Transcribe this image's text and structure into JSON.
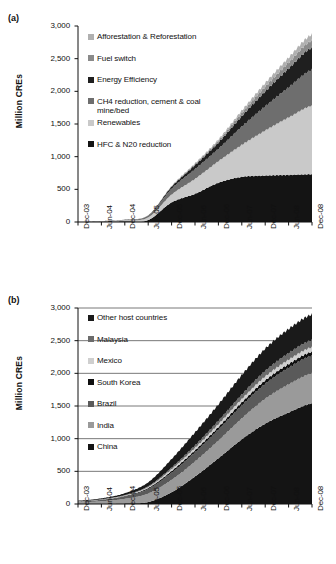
{
  "figure": {
    "background": "#ffffff",
    "panels": [
      {
        "id": "a",
        "label": "(a)",
        "ylabel": "Million CREs"
      },
      {
        "id": "b",
        "label": "(b)",
        "ylabel": "Million CREs"
      }
    ]
  },
  "chart_data": [
    {
      "type": "area",
      "panel": "a",
      "title": "",
      "xlabel": "",
      "ylabel": "Million CREs",
      "ylim": [
        0,
        3000
      ],
      "yticks": [
        0,
        500,
        1000,
        1500,
        2000,
        2500,
        3000
      ],
      "ytick_labels": [
        "0",
        "500",
        "1,000",
        "1,500",
        "2,000",
        "2,500",
        "3,000"
      ],
      "grid": false,
      "legend_position": "inside-top-left",
      "x": [
        "Dec-03",
        "Jun-04",
        "Dec-04",
        "Jun-05",
        "Dec-05",
        "Jun-06",
        "Dec-06",
        "Jun-07",
        "Dec-07",
        "Jun-08",
        "Dec-08"
      ],
      "xtick_labels": [
        "Dec-03",
        "Jun-04",
        "Dec-04",
        "Jun-05",
        "Dec-05",
        "Jun-06",
        "Dec-06",
        "Jun-07",
        "Dec-07",
        "Jun-08",
        "Dec-08"
      ],
      "stack_order_bottom_to_top": [
        "HFC & N20 reduction",
        "Renewables",
        "CH4 reduction, cement & coal mine/bed",
        "Energy Efficiency",
        "Fuel switch",
        "Afforestation & Reforestation"
      ],
      "series": [
        {
          "name": "HFC & N20 reduction",
          "color": "#141414",
          "values": [
            0,
            5,
            12,
            30,
            300,
            430,
            600,
            690,
            710,
            720,
            730
          ]
        },
        {
          "name": "Renewables",
          "color": "#c9c9c9",
          "values": [
            2,
            6,
            14,
            40,
            120,
            230,
            330,
            490,
            690,
            880,
            1050
          ]
        },
        {
          "name": "CH4 reduction, cement & coal mine/bed",
          "color": "#6e6e6e",
          "values": [
            1,
            3,
            8,
            25,
            90,
            150,
            190,
            280,
            370,
            460,
            550
          ]
        },
        {
          "name": "Energy Efficiency",
          "color": "#1f1f1f",
          "values": [
            0,
            1,
            2,
            6,
            30,
            60,
            95,
            160,
            230,
            290,
            340
          ]
        },
        {
          "name": "Fuel switch",
          "color": "#8a8a8a",
          "values": [
            0,
            0,
            1,
            2,
            8,
            18,
            30,
            50,
            70,
            90,
            110
          ]
        },
        {
          "name": "Afforestation & Reforestation",
          "color": "#b0b0b0",
          "values": [
            0,
            0,
            0,
            1,
            4,
            10,
            18,
            35,
            55,
            75,
            90
          ]
        }
      ],
      "cumulative_top_at_last_x": 2870,
      "legend": [
        {
          "label": "Afforestation & Reforestation",
          "color": "#b0b0b0"
        },
        {
          "label": "Fuel switch",
          "color": "#8a8a8a"
        },
        {
          "label": "Energy Efficiency",
          "color": "#1f1f1f"
        },
        {
          "label": "CH4 reduction, cement & coal\nmine/bed",
          "color": "#6e6e6e"
        },
        {
          "label": "Renewables",
          "color": "#c9c9c9"
        },
        {
          "label": "HFC & N20 reduction",
          "color": "#141414"
        }
      ]
    },
    {
      "type": "area",
      "panel": "b",
      "title": "",
      "xlabel": "",
      "ylabel": "Million CREs",
      "ylim": [
        0,
        3000
      ],
      "yticks": [
        0,
        500,
        1000,
        1500,
        2000,
        2500,
        3000
      ],
      "ytick_labels": [
        "0",
        "500",
        "1,000",
        "1,500",
        "2,000",
        "2,500",
        "3,000"
      ],
      "grid": true,
      "legend_position": "inside-top-left",
      "x": [
        "Dec-03",
        "Jun-04",
        "Dec-04",
        "Jun-05",
        "Dec-05",
        "Jun-06",
        "Dec-06",
        "Jun-07",
        "Dec-07",
        "Jun-08",
        "Dec-08"
      ],
      "xtick_labels": [
        "Dec-03",
        "Jun-04",
        "Dec-04",
        "Jun-05",
        "Dec-05",
        "Jun-06",
        "Dec-06",
        "Jun-07",
        "Dec-07",
        "Jun-08",
        "Dec-08"
      ],
      "stack_order_bottom_to_top": [
        "China",
        "India",
        "Brazil",
        "South Korea",
        "Mexico",
        "Malaysia",
        "Other host countries"
      ],
      "series": [
        {
          "name": "China",
          "color": "#141414",
          "values": [
            0,
            2,
            10,
            30,
            180,
            420,
            700,
            990,
            1230,
            1400,
            1540
          ]
        },
        {
          "name": "India",
          "color": "#9a9a9a",
          "values": [
            25,
            40,
            70,
            130,
            190,
            230,
            270,
            320,
            380,
            430,
            460
          ]
        },
        {
          "name": "Brazil",
          "color": "#5a5a5a",
          "values": [
            12,
            20,
            35,
            70,
            110,
            140,
            170,
            200,
            230,
            255,
            270
          ]
        },
        {
          "name": "South Korea",
          "color": "#0f0f0f",
          "values": [
            2,
            4,
            8,
            15,
            25,
            32,
            38,
            45,
            52,
            57,
            60
          ]
        },
        {
          "name": "Mexico",
          "color": "#cfcfcf",
          "values": [
            2,
            4,
            8,
            15,
            28,
            36,
            44,
            52,
            60,
            66,
            70
          ]
        },
        {
          "name": "Malaysia",
          "color": "#6b6b6b",
          "values": [
            2,
            3,
            6,
            12,
            25,
            38,
            52,
            68,
            85,
            100,
            110
          ]
        },
        {
          "name": "Other host countries",
          "color": "#1a1a1a",
          "values": [
            8,
            14,
            28,
            60,
            130,
            200,
            250,
            300,
            340,
            370,
            390
          ]
        }
      ],
      "cumulative_top_at_last_x": 2900,
      "legend": [
        {
          "label": "Other host countries",
          "color": "#1a1a1a"
        },
        {
          "label": "Malaysia",
          "color": "#6b6b6b"
        },
        {
          "label": "Mexico",
          "color": "#cfcfcf"
        },
        {
          "label": "South Korea",
          "color": "#0f0f0f"
        },
        {
          "label": "Brazil",
          "color": "#5a5a5a"
        },
        {
          "label": "India",
          "color": "#9a9a9a"
        },
        {
          "label": "China",
          "color": "#141414"
        }
      ]
    }
  ]
}
